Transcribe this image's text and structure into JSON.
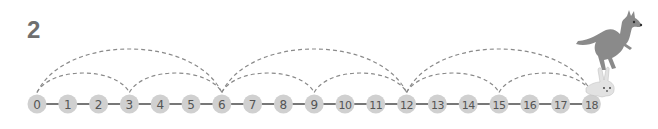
{
  "question_number": "2",
  "number_line": {
    "start": 0,
    "end": 18,
    "labels": [
      "0",
      "1",
      "2",
      "3",
      "4",
      "5",
      "6",
      "7",
      "8",
      "9",
      "10",
      "11",
      "12",
      "13",
      "14",
      "15",
      "16",
      "17",
      "18"
    ],
    "x0": 37,
    "spacing": 30.8,
    "y": 104,
    "radius": 9.5,
    "circle_color": "#d0d0d0",
    "line_color": "#777777",
    "text_color": "#555555"
  },
  "jumps": {
    "small": {
      "step": 3,
      "from": [
        0,
        3,
        6,
        9,
        12,
        15
      ],
      "label": "rabbit jumps of 3"
    },
    "large": {
      "step": 6,
      "from": [
        0,
        6,
        12
      ],
      "label": "kangaroo jumps of 6"
    },
    "dash_color": "#8a8a8a"
  },
  "characters": [
    {
      "name": "kangaroo",
      "color": "#8a8a8a"
    },
    {
      "name": "rabbit",
      "color": "#e0e0e0"
    }
  ]
}
